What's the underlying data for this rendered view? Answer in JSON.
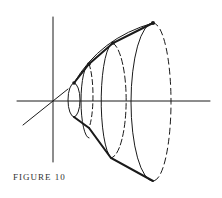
{
  "figure": {
    "caption": "FIGURE 10",
    "stroke_color": "#1a1a1a",
    "background": "#ffffff"
  }
}
